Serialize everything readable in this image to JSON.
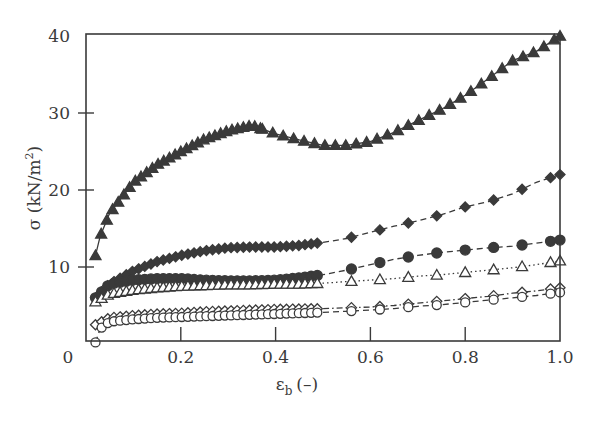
{
  "chart_data": {
    "type": "line",
    "title": "",
    "xlabel": "εb (–)",
    "xlabel_main": "ε",
    "xlabel_sub": "b",
    "xlabel_unit": "(–)",
    "ylabel": "σ (kN/m²)",
    "ylabel_main": "σ (kN/m",
    "ylabel_sup": "2",
    "ylabel_close": ")",
    "xlim": [
      0,
      1.0
    ],
    "ylim": [
      0,
      40
    ],
    "xticks": [
      0.2,
      0.4,
      0.6,
      0.8
    ],
    "xtick_labels": [
      "0",
      "0.2",
      "0.4",
      "0.6",
      "0.8",
      "1.0"
    ],
    "yticks": [
      10,
      20,
      30
    ],
    "ytick_labels": [
      "10",
      "20",
      "30",
      "40"
    ],
    "grid": false,
    "legend": "none",
    "series": [
      {
        "name": "filled triangles",
        "marker": "triangle-filled",
        "line": "solid",
        "x": [
          0.02,
          0.03,
          0.05,
          0.1,
          0.15,
          0.2,
          0.25,
          0.3,
          0.35,
          0.4,
          0.45,
          0.5,
          0.55,
          0.6,
          0.65,
          0.7,
          0.75,
          0.8,
          0.85,
          0.9,
          0.95,
          1.0
        ],
        "values": [
          11.5,
          14,
          17,
          21,
          23.3,
          25,
          26.6,
          27.7,
          28.4,
          27.3,
          26.5,
          25.8,
          25.8,
          26.3,
          27.5,
          29,
          30.5,
          32.3,
          34.5,
          36.8,
          38,
          40
        ]
      },
      {
        "name": "filled diamonds",
        "marker": "diamond-filled",
        "line": "dashed",
        "x": [
          0.02,
          0.05,
          0.1,
          0.15,
          0.2,
          0.25,
          0.3,
          0.35,
          0.4,
          0.45,
          0.5,
          0.55,
          0.6,
          0.65,
          0.7,
          0.75,
          0.8,
          0.85,
          0.9,
          0.95,
          1.0
        ],
        "values": [
          6,
          7.8,
          9.5,
          10.7,
          11.5,
          12.1,
          12.5,
          12.6,
          12.6,
          12.8,
          13.2,
          13.7,
          14.5,
          15.3,
          16,
          16.8,
          17.8,
          18.5,
          19.5,
          21,
          22
        ]
      },
      {
        "name": "filled circles",
        "marker": "circle-filled",
        "line": "dashed",
        "x": [
          0.02,
          0.05,
          0.1,
          0.15,
          0.2,
          0.25,
          0.3,
          0.35,
          0.4,
          0.45,
          0.5,
          0.55,
          0.6,
          0.65,
          0.7,
          0.75,
          0.8,
          0.85,
          0.9,
          0.95,
          1.0
        ],
        "values": [
          6,
          7.8,
          8.3,
          8.5,
          8.5,
          8.3,
          8.2,
          8.2,
          8.3,
          8.6,
          9,
          9.6,
          10.3,
          11,
          11.5,
          11.9,
          12.2,
          12.5,
          12.7,
          13.1,
          13.5
        ]
      },
      {
        "name": "open triangles",
        "marker": "triangle-open",
        "line": "dotted",
        "x": [
          0.02,
          0.05,
          0.1,
          0.15,
          0.2,
          0.25,
          0.3,
          0.35,
          0.4,
          0.45,
          0.5,
          0.55,
          0.6,
          0.65,
          0.7,
          0.75,
          0.8,
          0.85,
          0.9,
          0.95,
          1.0
        ],
        "values": [
          5.5,
          6.5,
          7,
          7.3,
          7.5,
          7.6,
          7.7,
          7.7,
          7.8,
          7.8,
          7.9,
          8.1,
          8.3,
          8.5,
          8.8,
          9,
          9.3,
          9.6,
          9.9,
          10.3,
          10.8
        ]
      },
      {
        "name": "open diamonds",
        "marker": "diamond-open",
        "line": "dash-dot",
        "x": [
          0.02,
          0.05,
          0.1,
          0.15,
          0.2,
          0.25,
          0.3,
          0.35,
          0.4,
          0.45,
          0.5,
          0.55,
          0.6,
          0.65,
          0.7,
          0.75,
          0.8,
          0.85,
          0.9,
          0.95,
          1.0
        ],
        "values": [
          2.5,
          3.4,
          3.7,
          3.9,
          4.0,
          4.2,
          4.3,
          4.4,
          4.5,
          4.55,
          4.6,
          4.7,
          4.8,
          5.0,
          5.3,
          5.6,
          5.9,
          6.2,
          6.6,
          6.9,
          7.3
        ]
      },
      {
        "name": "open circles",
        "marker": "circle-open",
        "line": "dashed",
        "x": [
          0.02,
          0.03,
          0.05,
          0.1,
          0.15,
          0.2,
          0.25,
          0.3,
          0.35,
          0.4,
          0.45,
          0.5,
          0.55,
          0.6,
          0.65,
          0.7,
          0.75,
          0.8,
          0.85,
          0.9,
          0.95,
          1.0
        ],
        "values": [
          0.2,
          2,
          2.9,
          3.2,
          3.4,
          3.5,
          3.6,
          3.7,
          3.8,
          3.9,
          4.0,
          4.1,
          4.25,
          4.4,
          4.6,
          4.9,
          5.1,
          5.4,
          5.7,
          6.0,
          6.3,
          6.7
        ]
      }
    ]
  }
}
